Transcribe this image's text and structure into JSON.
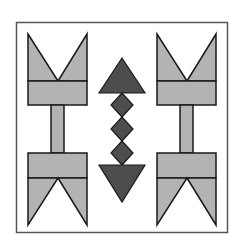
{
  "colors": {
    "background": "#ffffff",
    "frame": "#555555",
    "light_gray": "#b3b3b3",
    "dark_gray": "#4d4d4d",
    "outline": "#1a1a1a"
  },
  "shapes": {
    "frame": "square-border",
    "left_column": [
      "top-arrow-fletching",
      "stem",
      "bottom-arrow-fletching"
    ],
    "center_column": [
      "up-triangle",
      "diamond",
      "diamond",
      "diamond",
      "down-triangle"
    ],
    "right_column": [
      "top-arrow-fletching",
      "stem",
      "bottom-arrow-fletching"
    ]
  }
}
